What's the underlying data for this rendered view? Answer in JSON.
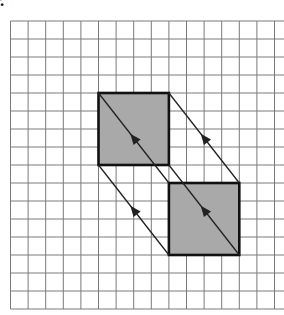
{
  "figure": {
    "label": "r.",
    "grid": {
      "origin_x": 10.5,
      "origin_y": 21,
      "cell_w": 17.6,
      "cell_h": 18,
      "cols": 16,
      "rows": 16,
      "line_color": "#7a7a7a"
    },
    "shapes": [
      {
        "name": "original-square",
        "col": 5,
        "row": 4,
        "size": 4,
        "fill": "#a9a9a9",
        "stroke": "#111111"
      },
      {
        "name": "translated-square",
        "col": 9,
        "row": 9,
        "size": 4,
        "fill": "#a9a9a9",
        "stroke": "#111111"
      }
    ],
    "translation": {
      "dx_cells": 4,
      "dy_cells": 5,
      "arrow_direction": "up-left"
    },
    "colors": {
      "square_fill": "#a9a9a9",
      "square_stroke": "#111111",
      "vector_line": "#222222",
      "grid_line": "#7a7a7a"
    }
  }
}
